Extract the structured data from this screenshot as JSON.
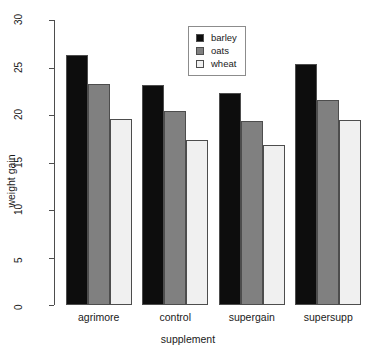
{
  "chart_data": {
    "type": "bar",
    "title": "",
    "subtitle": "",
    "xlabel": "supplement",
    "ylabel": "weight gain",
    "categories": [
      "agrimore",
      "control",
      "supergain",
      "supersupp"
    ],
    "series": [
      {
        "name": "barley",
        "color": "#0d0d0d",
        "values": [
          26.3,
          23.2,
          22.3,
          25.4
        ]
      },
      {
        "name": "oats",
        "color": "#808080",
        "values": [
          23.3,
          20.4,
          19.4,
          21.6
        ]
      },
      {
        "name": "wheat",
        "color": "#f0f0f0",
        "values": [
          19.6,
          17.4,
          16.8,
          19.5
        ]
      }
    ],
    "ylim": [
      0,
      30
    ],
    "yticks": [
      0,
      5,
      10,
      15,
      20,
      25,
      30
    ],
    "ytick_labels": [
      "0",
      "5",
      "10",
      "15",
      "20",
      "25",
      "30"
    ],
    "grid": false,
    "grouping": "beside",
    "legend": {
      "position": "top-center",
      "entries": [
        {
          "label": "barley",
          "color": "#0d0d0d"
        },
        {
          "label": "oats",
          "color": "#808080"
        },
        {
          "label": "wheat",
          "color": "#f0f0f0"
        }
      ]
    },
    "axis_color": "#4d4d4d",
    "bar_border_color": "#4d4d4d",
    "background": "#ffffff"
  }
}
